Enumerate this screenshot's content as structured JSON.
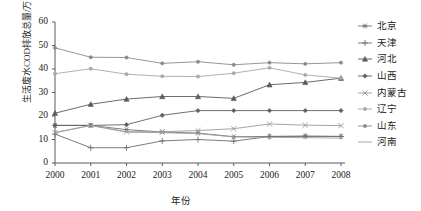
{
  "chart_data": {
    "type": "line",
    "title": "",
    "xlabel": "年份",
    "ylabel": "生活废水COD排放总量/万t",
    "x": [
      2000,
      2001,
      2002,
      2003,
      2004,
      2005,
      2006,
      2007,
      2008
    ],
    "xticklabels": [
      "2000",
      "2001",
      "2002",
      "2003",
      "2004",
      "2005",
      "2006",
      "2007",
      "2008"
    ],
    "yticklabels": [
      "0",
      "10",
      "20",
      "30",
      "40",
      "50",
      "60"
    ],
    "yticks": [
      0,
      10,
      20,
      30,
      40,
      50,
      60
    ],
    "ylim": [
      0,
      60
    ],
    "xlim": [
      2000,
      2008
    ],
    "grid": false,
    "legend_position": "right",
    "series": [
      {
        "name": "北京",
        "marker": "asterisk",
        "color": "#707070",
        "values": [
          16.0,
          16.0,
          14.2,
          13.2,
          12.7,
          11.2,
          11.3,
          11.4,
          11.3
        ]
      },
      {
        "name": "天津",
        "marker": "plus",
        "color": "#6e6e6e",
        "values": [
          12.3,
          6.5,
          6.5,
          9.4,
          10.0,
          9.3,
          11.3,
          11.4,
          11.3
        ]
      },
      {
        "name": "河北",
        "marker": "triangle",
        "color": "#5a5a5a",
        "values": [
          21.2,
          25.0,
          27.2,
          28.3,
          28.3,
          27.5,
          33.3,
          34.3,
          36.1
        ]
      },
      {
        "name": "山西",
        "marker": "diamond",
        "color": "#5f5f5f",
        "values": [
          16.0,
          16.0,
          16.3,
          20.3,
          22.3,
          22.3,
          22.3,
          22.3,
          22.3
        ]
      },
      {
        "name": "内蒙古",
        "marker": "cross",
        "color": "#9a9a9a",
        "values": [
          13.0,
          16.0,
          13.3,
          13.3,
          13.8,
          14.6,
          16.6,
          16.1,
          15.9
        ]
      },
      {
        "name": "辽宁",
        "marker": "dot",
        "color": "#a8a8a8",
        "values": [
          38.0,
          40.1,
          37.8,
          36.9,
          36.8,
          38.2,
          40.5,
          37.5,
          36.1
        ]
      },
      {
        "name": "山东",
        "marker": "dot",
        "color": "#8a8a8a",
        "values": [
          49.0,
          45.0,
          44.9,
          42.4,
          43.1,
          41.8,
          42.7,
          42.2,
          42.7
        ]
      },
      {
        "name": "河南",
        "marker": "none",
        "color": "#9e9e9e",
        "values": [
          12.8,
          16.0,
          13.1,
          12.9,
          12.5,
          11.1,
          10.9,
          10.8,
          10.6
        ]
      }
    ]
  },
  "axes": {
    "y_label": "生活废水COD排放总量/万t",
    "x_label": "年份"
  }
}
